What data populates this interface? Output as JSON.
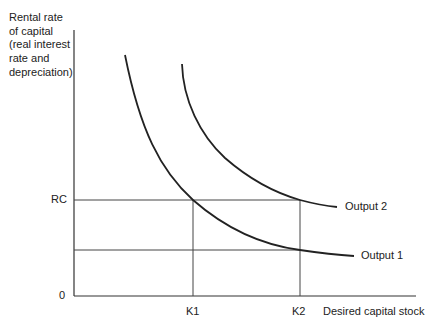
{
  "diagram": {
    "type": "economics-curve-diagram",
    "y_axis": {
      "label_lines": [
        "Rental rate",
        "of capital",
        "(real interest",
        "rate and",
        "depreciation)"
      ],
      "origin_label": "0",
      "tick_labels": [
        "RC"
      ]
    },
    "x_axis": {
      "label": "Desired capital stock",
      "tick_labels": [
        "K1",
        "K2"
      ]
    },
    "curves": [
      {
        "name": "Output 1",
        "label": "Output 1"
      },
      {
        "name": "Output 2",
        "label": "Output 2"
      }
    ],
    "reference_lines": {
      "horizontal": [
        "RC",
        "lower rate at K2 on Output 1"
      ],
      "vertical": [
        "K1",
        "K2"
      ]
    },
    "colors": {
      "line": "#222222",
      "grid": "#444444",
      "background": "#ffffff"
    }
  },
  "labels": {
    "y_axis_title": "Rental rate\nof capital\n(real interest\nrate and\ndepreciation)",
    "rc": "RC",
    "zero": "0",
    "k1": "K1",
    "k2": "K2",
    "x_axis_title": "Desired capital stock",
    "output1": "Output 1",
    "output2": "Output 2"
  }
}
